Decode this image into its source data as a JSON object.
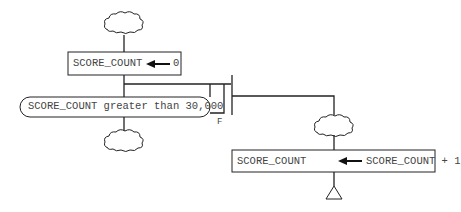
{
  "diagram": {
    "assign_init": {
      "target": "SCORE_COUNT",
      "value": "0"
    },
    "condition": {
      "text": "SCORE_COUNT greater than 30,000",
      "false_label": "F"
    },
    "assign_increment": {
      "target": "SCORE_COUNT",
      "value": "SCORE_COUNT + 1"
    },
    "colors": {
      "line": "#222222",
      "text": "#444444",
      "background": "#ffffff"
    }
  }
}
